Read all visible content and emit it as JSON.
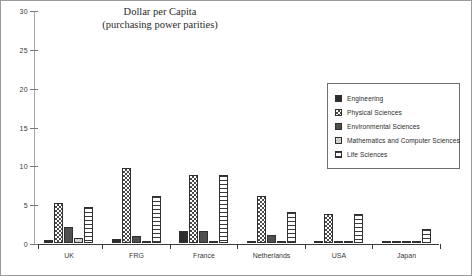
{
  "chart_data": {
    "type": "bar",
    "title": "Dollar per Capita (purchasing power parities)",
    "title_line1": "Dollar per Capita",
    "title_line2": "(purchasing power parities)",
    "xlabel": "",
    "ylabel": "",
    "ylim": [
      0,
      30
    ],
    "yticks": [
      0,
      5,
      10,
      15,
      20,
      25,
      30
    ],
    "ytick_labels": [
      "0",
      "5",
      "10",
      "15",
      "20",
      "25",
      "30"
    ],
    "grid": false,
    "legend_position": "right",
    "categories": [
      "UK",
      "FRG",
      "France",
      "Netherlands",
      "USA",
      "Japan"
    ],
    "series": [
      {
        "name": "Engineering",
        "pattern": "solid-dark",
        "values": [
          0.4,
          0.5,
          1.5,
          0.15,
          0.15,
          0.1
        ]
      },
      {
        "name": "Physical Sciences",
        "pattern": "checkerboard",
        "values": [
          5.2,
          9.7,
          8.8,
          6.0,
          3.7,
          0.2
        ]
      },
      {
        "name": "Environmental Sciences",
        "pattern": "solid-grey",
        "values": [
          2.0,
          0.9,
          1.5,
          1.0,
          0.25,
          0.25
        ]
      },
      {
        "name": "Mathematics and Computer Sciences",
        "pattern": "pale-speckle",
        "values": [
          0.6,
          0.15,
          0.2,
          0.2,
          0.1,
          0.1
        ]
      },
      {
        "name": "Life Sciences",
        "pattern": "horizontal-stripes",
        "values": [
          4.6,
          6.0,
          8.8,
          4.0,
          3.7,
          1.8
        ]
      }
    ]
  },
  "legend": {
    "items": [
      {
        "label": "Engineering"
      },
      {
        "label": "Physical Sciences"
      },
      {
        "label": "Environmental Sciences"
      },
      {
        "label": "Mathematics and Computer Sciences"
      },
      {
        "label": "Life Sciences"
      }
    ]
  },
  "colors": {
    "engineering": "#2d2d2d",
    "physical": "#4a4a4a",
    "environmental": "#4f4f4f",
    "math": "#b5b5b5",
    "life": "#3a3a3a",
    "axis": "#3a3a3a",
    "frame": "#9a9a9a"
  }
}
